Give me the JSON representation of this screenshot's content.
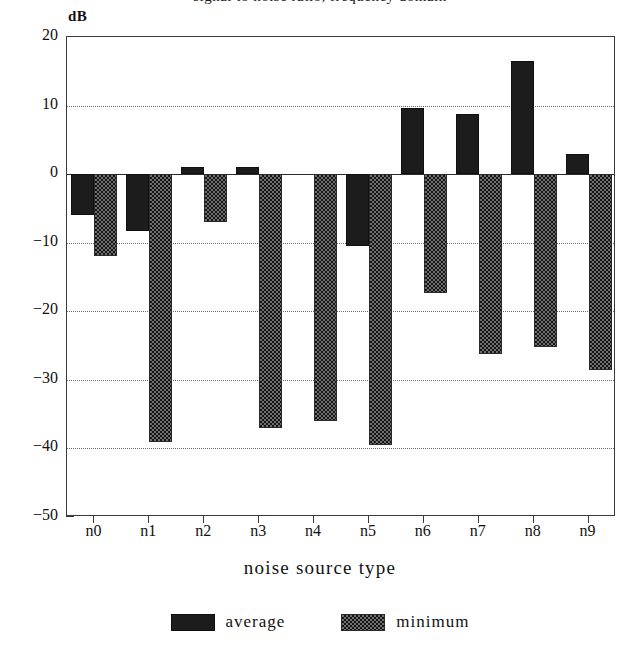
{
  "figure": {
    "title_clipped": "signal to noise ratio, frequency domain",
    "y_axis_unit_label": "dB",
    "x_axis_title": "noise source type"
  },
  "legend": {
    "position": "bottom-center",
    "entries": [
      {
        "label": "average",
        "swatch": "solid-dark"
      },
      {
        "label": "minimum",
        "swatch": "dithered-checker"
      }
    ]
  },
  "chart_data": {
    "type": "bar",
    "title": "",
    "xlabel": "noise source type",
    "ylabel": "dB",
    "ylim": [
      -50,
      20
    ],
    "yticks": [
      20,
      10,
      0,
      -10,
      -20,
      -30,
      -40,
      -50
    ],
    "ytick_labels": [
      "20",
      "10",
      "0",
      "-10",
      "-20",
      "-30",
      "-40",
      "-50"
    ],
    "grid": true,
    "grid_style": "dotted-horizontal",
    "zero_line": true,
    "categories": [
      "n0",
      "n1",
      "n2",
      "n3",
      "n4",
      "n5",
      "n6",
      "n7",
      "n8",
      "n9"
    ],
    "series": [
      {
        "name": "average",
        "values": [
          -6,
          -8.3,
          1,
          1,
          0,
          -10.5,
          9.7,
          8.8,
          16.5,
          3
        ]
      },
      {
        "name": "minimum",
        "values": [
          -12,
          -39,
          -7,
          -37,
          -36,
          -39.5,
          -17.3,
          -26.3,
          -25.2,
          -28.5
        ]
      }
    ]
  }
}
